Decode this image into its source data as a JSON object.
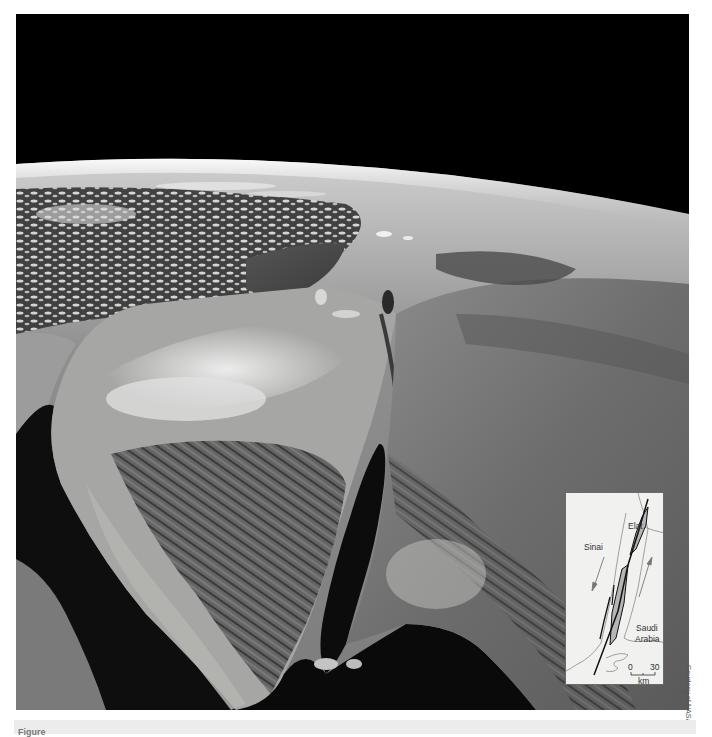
{
  "photo": {
    "description": "Satellite view from orbit of the Sinai Peninsula, Gulf of Suez, Gulf of Aqaba, Dead Sea and Arabian Peninsula, with Earth's curved horizon against black space",
    "colors": {
      "space": "#000000",
      "atmosphere_glow": "#d9d9d9",
      "sea_dark": "#101010",
      "mediterranean": "#4a4a4a",
      "desert_light": "#a9a9a7",
      "clouds": "#e8e8e8",
      "mountains": "#555555"
    }
  },
  "inset_map": {
    "labels": {
      "elat": "Elat",
      "sinai": "Sinai",
      "saudi": "Saudi",
      "arabia": "Arabia",
      "scale_start": "0",
      "scale_end": "30",
      "scale_unit": "km"
    },
    "colors": {
      "background": "#f1f1ef",
      "fault_line": "#111111",
      "basin_fill": "#b5b5b5",
      "coastline": "#8a8a8a"
    }
  },
  "credit": {
    "text": "Courtesy of NASA"
  },
  "caption": {
    "partial_label": "Figure"
  }
}
